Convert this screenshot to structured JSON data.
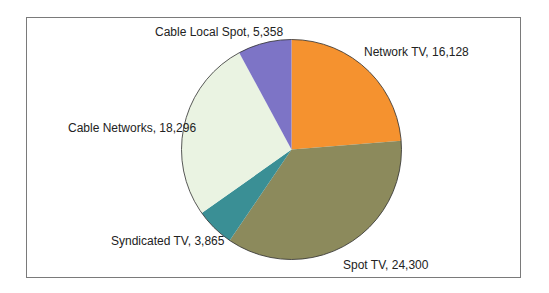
{
  "chart_data": {
    "type": "pie",
    "title": "",
    "start_angle_deg": 0,
    "direction": "clockwise",
    "slices": [
      {
        "label": "Network TV",
        "value": 16128,
        "display": "Network TV, 16,128",
        "color": "#f5922f"
      },
      {
        "label": "Spot TV",
        "value": 24300,
        "display": "Spot TV, 24,300",
        "color": "#8c8a5c"
      },
      {
        "label": "Syndicated TV",
        "value": 3865,
        "display": "Syndicated TV, 3,865",
        "color": "#3a8f95"
      },
      {
        "label": "Cable Networks",
        "value": 18296,
        "display": "Cable Networks, 18,296",
        "color": "#eaf3e2"
      },
      {
        "label": "Cable Local Spot",
        "value": 5358,
        "display": "Cable Local Spot, 5,358",
        "color": "#7d74c6"
      }
    ],
    "legend": "none (slices labeled directly)"
  }
}
